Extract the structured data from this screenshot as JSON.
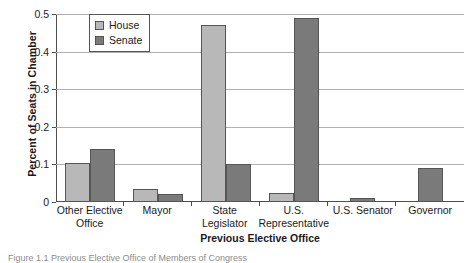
{
  "chart_data": {
    "type": "bar",
    "title": "",
    "xlabel": "Previous Elective Office",
    "ylabel": "Percent of Seats in Chamber",
    "categories": [
      "Other Elective Office",
      "Mayor",
      "State Legislator",
      "U.S. Representative",
      "U.S. Senator",
      "Governor"
    ],
    "category_lines": [
      [
        "Other Elective",
        "Office"
      ],
      [
        "Mayor"
      ],
      [
        "State",
        "Legislator"
      ],
      [
        "U.S.",
        "Representative"
      ],
      [
        "U.S. Senator"
      ],
      [
        "Governor"
      ]
    ],
    "series": [
      {
        "name": "House",
        "color": "#b8b8b8",
        "values": [
          0.105,
          0.035,
          0.47,
          0.025,
          0.0,
          0.0
        ]
      },
      {
        "name": "Senate",
        "color": "#7a7a7a",
        "values": [
          0.14,
          0.02,
          0.1,
          0.49,
          0.01,
          0.09
        ]
      }
    ],
    "ylim": [
      0,
      0.5
    ],
    "yticks": [
      0,
      0.1,
      0.2,
      0.3,
      0.4,
      0.5
    ],
    "ytick_labels": [
      "0",
      "0.1",
      "0.2",
      "0.3",
      "0.4",
      "0.5"
    ],
    "grid": "horizontal",
    "legend_position": "top-left-inside",
    "legend_entries": [
      "House",
      "Senate"
    ]
  },
  "caption": {
    "text": "Figure 1.1 Previous Elective Office of Members of Congress"
  }
}
